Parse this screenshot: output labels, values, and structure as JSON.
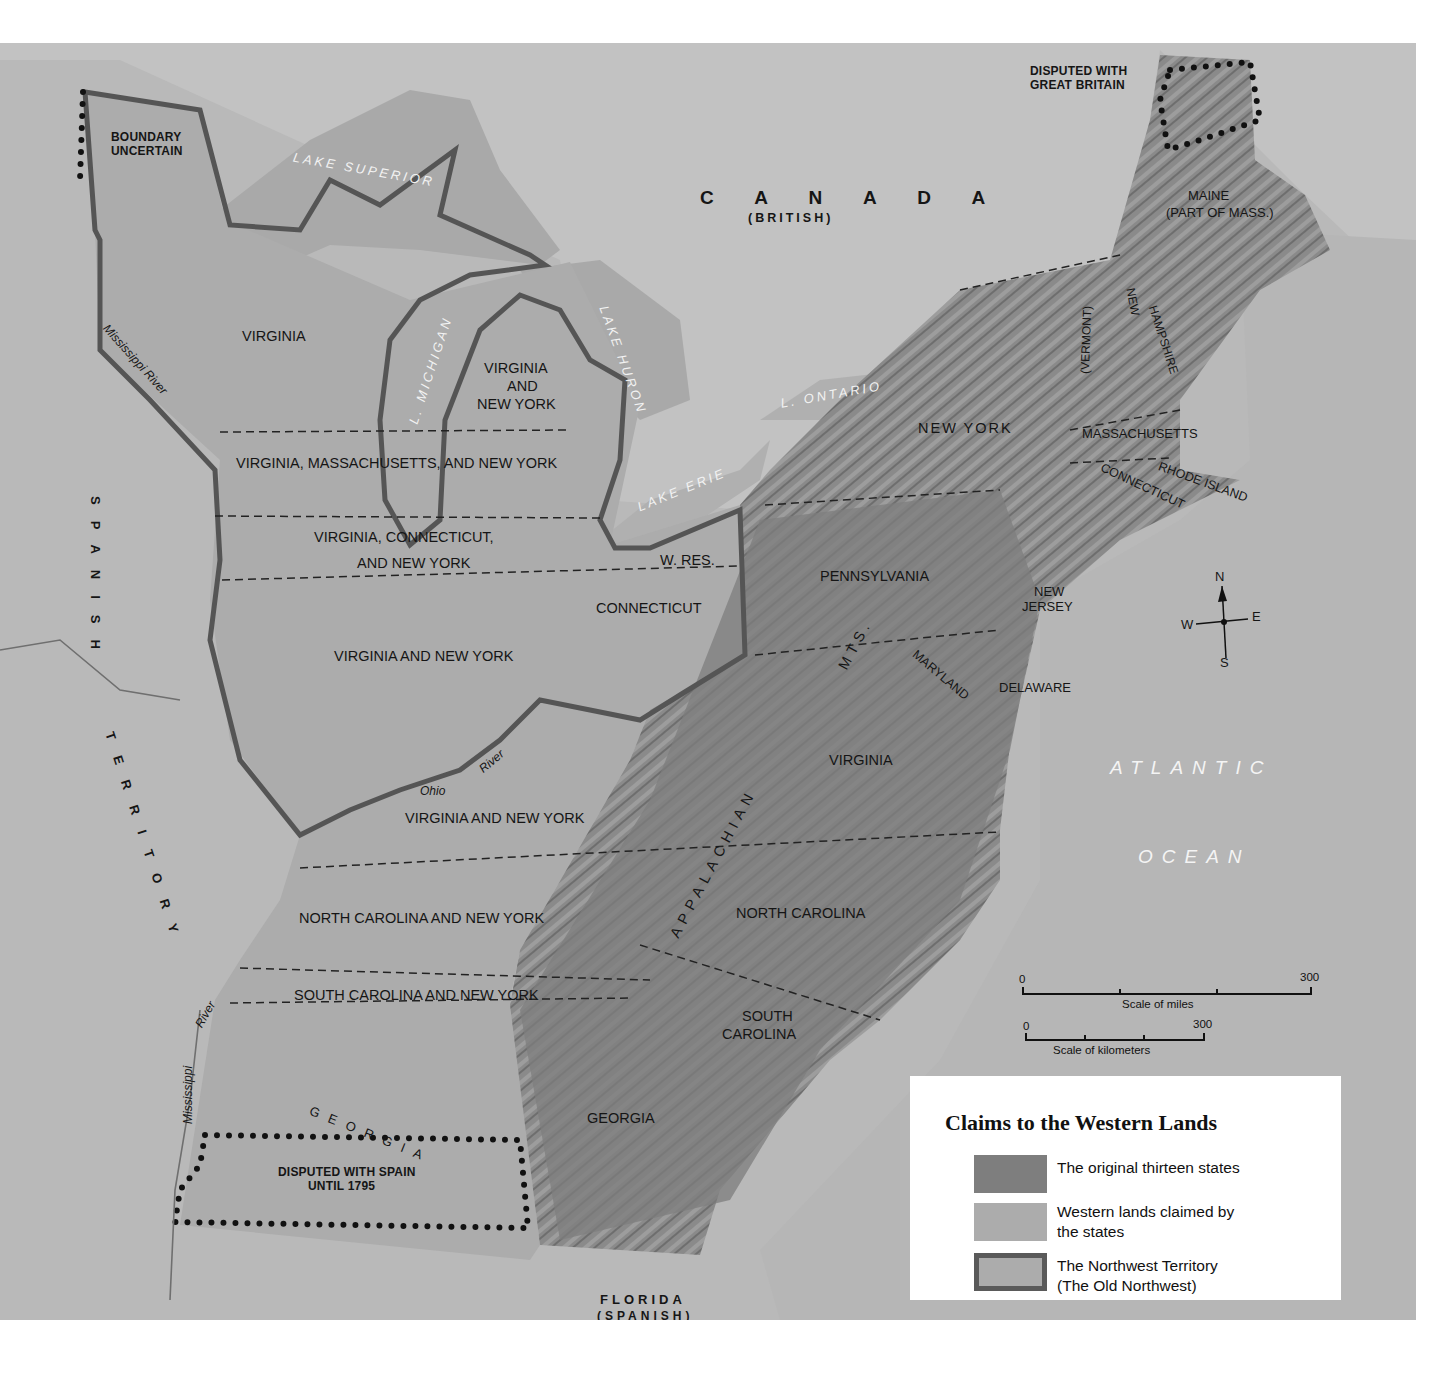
{
  "map": {
    "title": "Claims to the Western Lands",
    "legend": [
      {
        "label_line1": "The original thirteen states",
        "label_line2": "",
        "color": "#7e7e7e",
        "style": "fill"
      },
      {
        "label_line1": "Western lands claimed by",
        "label_line2": "the states",
        "color": "#acacac",
        "style": "fill"
      },
      {
        "label_line1": "The Northwest Territory",
        "label_line2": "(The Old Northwest)",
        "color": "#acacac",
        "border_color": "#5a5a5a",
        "style": "bordered"
      }
    ],
    "colors": {
      "background": "#b9b9b9",
      "foreign_land": "#bdbdbd",
      "lakes": "#a8a8a8",
      "original_states": "#7e7e7e",
      "western_lands": "#acacac",
      "nw_border": "#555555",
      "ocean": "#b4b4b4"
    },
    "foreign": {
      "canada": "C A N A D A",
      "canada_sub": "(BRITISH)",
      "spanish_territory_1": "SPANISH",
      "spanish_territory_2": "TERRITORY",
      "florida": "FLORIDA",
      "florida_sub": "(SPANISH)"
    },
    "annotations": {
      "boundary_uncertain_1": "BOUNDARY",
      "boundary_uncertain_2": "UNCERTAIN",
      "disputed_gb_1": "DISPUTED WITH",
      "disputed_gb_2": "GREAT BRITAIN",
      "disputed_spain_1": "DISPUTED WITH SPAIN",
      "disputed_spain_2": "UNTIL 1795",
      "w_res": "W. RES."
    },
    "water": {
      "lake_superior": "LAKE SUPERIOR",
      "lake_michigan": "L. MICHIGAN",
      "lake_huron": "LAKE HURON",
      "lake_erie": "LAKE ERIE",
      "lake_ontario": "L. ONTARIO",
      "atlantic": "ATLANTIC",
      "ocean": "OCEAN"
    },
    "rivers": {
      "mississippi_north": "Mississippi River",
      "mississippi_south_1": "Mississippi",
      "mississippi_south_2": "River",
      "ohio_1": "Ohio",
      "ohio_2": "River"
    },
    "mountains": {
      "appalachian": "APPALACHIAN",
      "mts": "MTS."
    },
    "western_claims": [
      "VIRGINIA",
      "VIRGINIA",
      "AND",
      "NEW YORK",
      "VIRGINIA, MASSACHUSETTS, AND NEW YORK",
      "VIRGINIA, CONNECTICUT,",
      "AND NEW YORK",
      "CONNECTICUT",
      "VIRGINIA AND NEW YORK",
      "VIRGINIA AND NEW YORK",
      "NORTH CAROLINA AND NEW YORK",
      "SOUTH CAROLINA AND NEW YORK",
      "GEORGIA"
    ],
    "states": {
      "maine_1": "MAINE",
      "maine_2": "(PART OF MASS.)",
      "new_hampshire_1": "NEW",
      "new_hampshire_2": "HAMPSHIRE",
      "vermont": "(VERMONT)",
      "massachusetts": "MASSACHUSETTS",
      "rhode_island": "RHODE ISLAND",
      "connecticut": "CONNECTICUT",
      "new_york": "NEW YORK",
      "pennsylvania": "PENNSYLVANIA",
      "new_jersey_1": "NEW",
      "new_jersey_2": "JERSEY",
      "delaware": "DELAWARE",
      "maryland": "MARYLAND",
      "virginia": "VIRGINIA",
      "north_carolina": "NORTH CAROLINA",
      "south_carolina_1": "SOUTH",
      "south_carolina_2": "CAROLINA",
      "georgia": "GEORGIA"
    },
    "compass": {
      "n": "N",
      "s": "S",
      "e": "E",
      "w": "W"
    },
    "scale": {
      "miles_zero": "0",
      "miles_max": "300",
      "miles_label": "Scale of miles",
      "km_zero": "0",
      "km_max": "300",
      "km_label": "Scale of kilometers"
    }
  }
}
